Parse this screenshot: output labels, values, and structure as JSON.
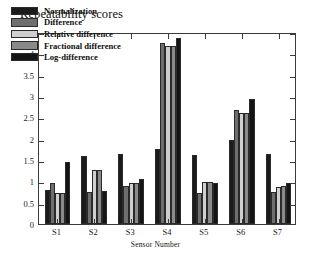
{
  "chart_data": {
    "type": "bar",
    "title": "Repeatability scores",
    "xlabel": "Sensor Number",
    "ylabel": "",
    "categories": [
      "S1",
      "S2",
      "S3",
      "S4",
      "S5",
      "S6",
      "S7"
    ],
    "ylim": [
      0,
      4.5
    ],
    "yticks": [
      "0",
      "0.5",
      "1",
      "1.5",
      "2",
      "2.5",
      "3",
      "3.5",
      "4",
      "4.5"
    ],
    "ytick_values": [
      0,
      0.5,
      1,
      1.5,
      2,
      2.5,
      3,
      3.5,
      4,
      4.5
    ],
    "grid": false,
    "legend_position": "upper-left",
    "series": [
      {
        "name": "Normalization",
        "color": "#1b1b1b",
        "values": [
          0.8,
          1.6,
          1.65,
          1.75,
          1.62,
          1.98,
          1.65
        ]
      },
      {
        "name": "Difference",
        "color": "#6e6e6e",
        "values": [
          0.95,
          0.74,
          0.88,
          4.25,
          0.73,
          2.68,
          0.74
        ]
      },
      {
        "name": "Relative difference",
        "color": "#cfcfcf",
        "values": [
          0.72,
          1.26,
          0.95,
          4.18,
          0.98,
          2.6,
          0.86
        ]
      },
      {
        "name": "Fractional difference",
        "color": "#8a8a8a",
        "values": [
          0.72,
          1.26,
          0.97,
          4.18,
          0.98,
          2.6,
          0.9
        ]
      },
      {
        "name": "Log-difference",
        "color": "#141414",
        "values": [
          1.45,
          0.78,
          1.05,
          4.35,
          0.95,
          2.92,
          0.96
        ]
      }
    ]
  },
  "axis": {
    "color": "#3b3b3b"
  }
}
